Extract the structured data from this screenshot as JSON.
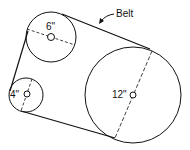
{
  "diagram": {
    "type": "belt-pulley-system",
    "callout_label": "Belt",
    "pulleys": [
      {
        "id": "small",
        "label": "4\"",
        "cx": 26,
        "cy": 95,
        "r": 17
      },
      {
        "id": "medium",
        "label": "6\"",
        "cx": 51,
        "cy": 37,
        "r": 25
      },
      {
        "id": "large",
        "label": "12\"",
        "cx": 133,
        "cy": 95,
        "r": 48
      }
    ],
    "colors": {
      "stroke": "#111111",
      "background": "#ffffff"
    }
  }
}
